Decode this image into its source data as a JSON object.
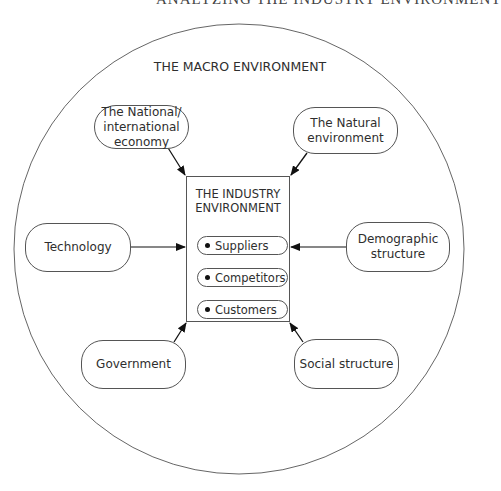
{
  "header": {
    "text": "ANALYZING THE INDUSTRY ENVIRONMENT"
  },
  "macro": {
    "title": "THE MACRO ENVIRONMENT"
  },
  "industry": {
    "title_line1": "THE INDUSTRY",
    "title_line2": "ENVIRONMENT",
    "items": [
      {
        "label": "Suppliers"
      },
      {
        "label": "Competitors"
      },
      {
        "label": "Customers"
      }
    ]
  },
  "factors": {
    "economy": {
      "line1": "The National/",
      "line2": "international",
      "line3": "economy"
    },
    "natural": {
      "line1": "The Natural",
      "line2": "environment"
    },
    "technology": {
      "label": "Technology"
    },
    "demographic": {
      "line1": "Demographic",
      "line2": "structure"
    },
    "government": {
      "label": "Government"
    },
    "social": {
      "label": "Social structure"
    }
  },
  "colors": {
    "line": "#555555",
    "arrow": "#111111",
    "text": "#2e2e2e"
  }
}
